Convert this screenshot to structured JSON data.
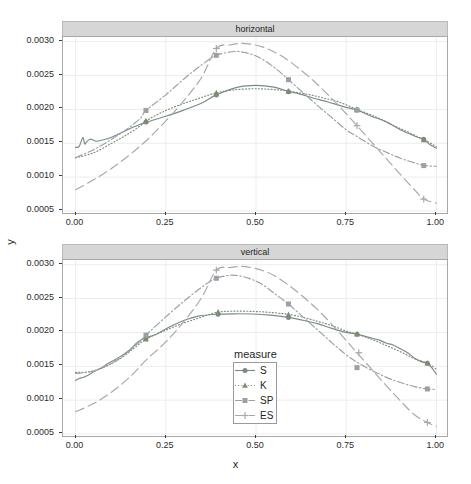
{
  "chart_data": {
    "type": "line",
    "title": "",
    "xlabel": "x",
    "ylabel": "y",
    "xlim": [
      -0.035,
      1.035
    ],
    "ylim": [
      0.00047,
      0.00307
    ],
    "grid": true,
    "facet_variable": "panel",
    "facets": [
      "horizontal",
      "vertical"
    ],
    "legend_title": "measure",
    "legend_position": "inside-bottom-panel",
    "xticks": [
      "0.00",
      "0.25",
      "0.50",
      "0.75",
      "1.00"
    ],
    "xtick_values": [
      0.0,
      0.25,
      0.5,
      0.75,
      1.0
    ],
    "yticks": [
      "0.0005",
      "0.0010",
      "0.0015",
      "0.0020",
      "0.0025",
      "0.0030"
    ],
    "ytick_values": [
      0.0005,
      0.001,
      0.0015,
      0.002,
      0.0025,
      0.003
    ],
    "series": [
      {
        "name": "S",
        "linetype": "solid",
        "glyph": "circle",
        "color": "#7b8a8b",
        "panels": {
          "horizontal": {
            "x": [
              0.0,
              0.01,
              0.02,
              0.025,
              0.03,
              0.04,
              0.05,
              0.06,
              0.08,
              0.1,
              0.12,
              0.14,
              0.16,
              0.18,
              0.2,
              0.25,
              0.3,
              0.35,
              0.39,
              0.45,
              0.5,
              0.55,
              0.59,
              0.62,
              0.66,
              0.7,
              0.74,
              0.78,
              0.82,
              0.86,
              0.9,
              0.93,
              0.95,
              0.965,
              0.98,
              1.0
            ],
            "y": [
              0.00144,
              0.001455,
              0.001585,
              0.00149,
              0.00152,
              0.00156,
              0.001545,
              0.00153,
              0.001555,
              0.00159,
              0.00164,
              0.00169,
              0.00174,
              0.00178,
              0.001818,
              0.0019,
              0.00199,
              0.002095,
              0.002215,
              0.00233,
              0.002355,
              0.00233,
              0.002265,
              0.00223,
              0.002165,
              0.00211,
              0.002045,
              0.00199,
              0.0019,
              0.00182,
              0.0017,
              0.00163,
              0.001585,
              0.00156,
              0.00149,
              0.001425
            ]
          },
          "vertical": {
            "x": [
              0.0,
              0.01,
              0.02,
              0.03,
              0.05,
              0.07,
              0.09,
              0.11,
              0.13,
              0.15,
              0.17,
              0.19,
              0.22,
              0.26,
              0.3,
              0.34,
              0.39,
              0.44,
              0.49,
              0.54,
              0.59,
              0.63,
              0.67,
              0.71,
              0.75,
              0.78,
              0.81,
              0.84,
              0.86,
              0.88,
              0.9,
              0.92,
              0.94,
              0.96,
              0.975,
              0.985,
              1.0
            ],
            "y": [
              0.00129,
              0.00132,
              0.001335,
              0.001355,
              0.00142,
              0.00147,
              0.00154,
              0.0016,
              0.001665,
              0.00174,
              0.00185,
              0.001915,
              0.001965,
              0.00208,
              0.002175,
              0.00224,
              0.002268,
              0.002275,
              0.002272,
              0.002255,
              0.002222,
              0.00218,
              0.00213,
              0.00206,
              0.002,
              0.001975,
              0.00193,
              0.00189,
              0.001845,
              0.001815,
              0.00176,
              0.0017,
              0.00162,
              0.001565,
              0.001545,
              0.00149,
              0.001385
            ]
          }
        },
        "points": {
          "horizontal": [
            [
              0.195,
              0.001815
            ],
            [
              0.39,
              0.002215
            ],
            [
              0.59,
              0.002262
            ],
            [
              0.78,
              0.00199
            ],
            [
              0.965,
              0.00156
            ]
          ],
          "vertical": [
            [
              0.195,
              0.001915
            ],
            [
              0.395,
              0.00227
            ],
            [
              0.59,
              0.002222
            ],
            [
              0.78,
              0.001972
            ],
            [
              0.975,
              0.001545
            ]
          ]
        }
      },
      {
        "name": "K",
        "linetype": "dotted",
        "glyph": "triangle",
        "color": "#7f8c6d",
        "panels": {
          "horizontal": {
            "x": [
              0.0,
              0.05,
              0.1,
              0.14,
              0.18,
              0.195,
              0.24,
              0.29,
              0.34,
              0.39,
              0.44,
              0.49,
              0.53,
              0.57,
              0.61,
              0.65,
              0.69,
              0.73,
              0.78,
              0.83,
              0.88,
              0.92,
              0.95,
              0.97,
              1.0
            ],
            "y": [
              0.001285,
              0.00136,
              0.0015,
              0.00162,
              0.00176,
              0.00183,
              0.00196,
              0.00207,
              0.00216,
              0.002245,
              0.00229,
              0.002305,
              0.0023,
              0.002285,
              0.002255,
              0.002215,
              0.002165,
              0.00211,
              0.002,
              0.001895,
              0.001765,
              0.00167,
              0.00159,
              0.001545,
              0.00145
            ]
          },
          "vertical": {
            "x": [
              0.0,
              0.04,
              0.08,
              0.12,
              0.16,
              0.195,
              0.24,
              0.29,
              0.34,
              0.39,
              0.44,
              0.49,
              0.53,
              0.57,
              0.59,
              0.63,
              0.67,
              0.71,
              0.75,
              0.78,
              0.82,
              0.86,
              0.9,
              0.94,
              0.975,
              1.0
            ],
            "y": [
              0.00141,
              0.00142,
              0.00149,
              0.0016,
              0.00176,
              0.0019,
              0.00201,
              0.00212,
              0.00221,
              0.002295,
              0.002315,
              0.00231,
              0.0023,
              0.00228,
              0.002268,
              0.002225,
              0.002165,
              0.0021,
              0.00202,
              0.001975,
              0.0019,
              0.00181,
              0.001715,
              0.00161,
              0.001545,
              0.001455
            ]
          }
        },
        "points": {
          "horizontal": [
            [
              0.195,
              0.00183
            ],
            [
              0.39,
              0.002245
            ],
            [
              0.59,
              0.00227
            ],
            [
              0.78,
              0.002
            ],
            [
              0.965,
              0.00155
            ]
          ],
          "vertical": [
            [
              0.195,
              0.0019
            ],
            [
              0.395,
              0.0023
            ],
            [
              0.59,
              0.002262
            ],
            [
              0.78,
              0.001975
            ],
            [
              0.975,
              0.001545
            ]
          ]
        }
      },
      {
        "name": "SP",
        "linetype": "dashdot",
        "glyph": "square",
        "color": "#9aa0a6",
        "panels": {
          "horizontal": {
            "x": [
              0.0,
              0.05,
              0.1,
              0.14,
              0.18,
              0.195,
              0.25,
              0.3,
              0.35,
              0.39,
              0.44,
              0.47,
              0.5,
              0.53,
              0.56,
              0.59,
              0.63,
              0.67,
              0.71,
              0.75,
              0.78,
              0.82,
              0.86,
              0.9,
              0.94,
              0.97,
              1.0
            ],
            "y": [
              0.00129,
              0.001405,
              0.00156,
              0.0017,
              0.00187,
              0.001985,
              0.002215,
              0.00245,
              0.00266,
              0.0028,
              0.002855,
              0.00284,
              0.00279,
              0.0027,
              0.00258,
              0.00244,
              0.00225,
              0.00206,
              0.00188,
              0.0017,
              0.0016,
              0.00147,
              0.00137,
              0.00128,
              0.00121,
              0.00117,
              0.00116
            ]
          },
          "vertical": {
            "x": [
              0.0,
              0.05,
              0.1,
              0.14,
              0.18,
              0.195,
              0.25,
              0.3,
              0.35,
              0.39,
              0.43,
              0.46,
              0.49,
              0.52,
              0.55,
              0.59,
              0.63,
              0.67,
              0.71,
              0.75,
              0.78,
              0.82,
              0.86,
              0.9,
              0.94,
              0.975,
              1.0
            ],
            "y": [
              0.001395,
              0.00143,
              0.001545,
              0.00169,
              0.001875,
              0.00196,
              0.00223,
              0.00246,
              0.00267,
              0.0028,
              0.002845,
              0.00283,
              0.00278,
              0.0027,
              0.00258,
              0.00242,
              0.00223,
              0.00204,
              0.00185,
              0.00167,
              0.00156,
              0.00144,
              0.00134,
              0.00126,
              0.0012,
              0.001165,
              0.00116
            ]
          }
        },
        "points": {
          "horizontal": [
            [
              0.195,
              0.001985
            ],
            [
              0.39,
              0.0028
            ],
            [
              0.59,
              0.00244
            ],
            [
              0.78,
              0.00199
            ],
            [
              0.965,
              0.00117
            ]
          ],
          "vertical": [
            [
              0.195,
              0.00196
            ],
            [
              0.39,
              0.0028
            ],
            [
              0.59,
              0.00242
            ],
            [
              0.78,
              0.00148
            ],
            [
              0.975,
              0.001165
            ]
          ]
        }
      },
      {
        "name": "ES",
        "linetype": "longdash",
        "glyph": "plus",
        "color": "#a8a8a8",
        "panels": {
          "horizontal": {
            "x": [
              0.0,
              0.05,
              0.1,
              0.15,
              0.2,
              0.25,
              0.3,
              0.35,
              0.39,
              0.43,
              0.46,
              0.49,
              0.52,
              0.55,
              0.58,
              0.62,
              0.66,
              0.7,
              0.74,
              0.78,
              0.82,
              0.86,
              0.9,
              0.94,
              0.965,
              1.0
            ],
            "y": [
              0.000815,
              0.00096,
              0.00113,
              0.00133,
              0.00156,
              0.00183,
              0.00213,
              0.00248,
              0.0029,
              0.002955,
              0.002975,
              0.00296,
              0.00292,
              0.00285,
              0.00276,
              0.0026,
              0.00242,
              0.002215,
              0.001995,
              0.00176,
              0.00152,
              0.00128,
              0.00104,
              0.00081,
              0.000675,
              0.000615
            ]
          },
          "vertical": {
            "x": [
              0.0,
              0.05,
              0.1,
              0.15,
              0.195,
              0.25,
              0.3,
              0.35,
              0.39,
              0.43,
              0.46,
              0.49,
              0.52,
              0.55,
              0.59,
              0.63,
              0.67,
              0.71,
              0.75,
              0.78,
              0.82,
              0.86,
              0.9,
              0.94,
              0.975,
              1.0
            ],
            "y": [
              0.00083,
              0.00095,
              0.00112,
              0.00134,
              0.00159,
              0.00186,
              0.00216,
              0.00252,
              0.00292,
              0.00296,
              0.002975,
              0.002955,
              0.00291,
              0.00284,
              0.0027,
              0.00253,
              0.00234,
              0.00212,
              0.00188,
              0.0017,
              0.00146,
              0.00122,
              0.00099,
              0.00078,
              0.00067,
              0.000615
            ]
          }
        },
        "points": {
          "horizontal": [
            [
              0.39,
              0.0029
            ],
            [
              0.78,
              0.00176
            ],
            [
              0.965,
              0.000675
            ]
          ],
          "vertical": [
            [
              0.39,
              0.00292
            ],
            [
              0.785,
              0.0017
            ],
            [
              0.975,
              0.00067
            ]
          ]
        }
      }
    ],
    "legend_entries": [
      {
        "label": "S",
        "glyph": "circle",
        "linetype": "solid"
      },
      {
        "label": "K",
        "glyph": "triangle",
        "linetype": "dotted"
      },
      {
        "label": "SP",
        "glyph": "square",
        "linetype": "dashdot"
      },
      {
        "label": "ES",
        "glyph": "plus",
        "linetype": "longdash"
      }
    ]
  },
  "panels": {
    "top": {
      "strip_label": "horizontal"
    },
    "bottom": {
      "strip_label": "vertical"
    }
  },
  "axes": {
    "x_title": "x",
    "y_title": "y"
  }
}
